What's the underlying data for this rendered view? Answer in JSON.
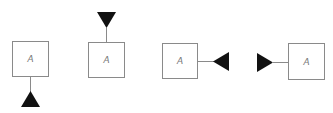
{
  "diagram": {
    "colors": {
      "box_border": "#8a8a8a",
      "stem": "#8a8a8a",
      "triangle": "#111111",
      "label": "#777777",
      "background": "#ffffff"
    },
    "items": [
      {
        "label": "A",
        "connector_side": "bottom",
        "triangle_direction": "up"
      },
      {
        "label": "A",
        "connector_side": "top",
        "triangle_direction": "down"
      },
      {
        "label": "A",
        "connector_side": "right",
        "triangle_direction": "left"
      },
      {
        "label": "A",
        "connector_side": "left",
        "triangle_direction": "right"
      }
    ]
  }
}
